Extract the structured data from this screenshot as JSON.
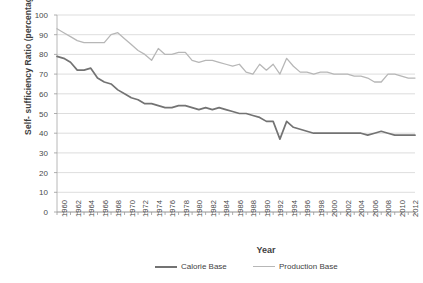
{
  "chart_data": {
    "type": "line",
    "title": "",
    "xlabel": "Year",
    "ylabel": "Self- sufficiency Ratio (percentage)",
    "ylim": [
      0,
      100
    ],
    "ytick_step": 10,
    "yticks": [
      "0",
      "10",
      "20",
      "30",
      "40",
      "50",
      "60",
      "70",
      "80",
      "90",
      "100"
    ],
    "xlim": [
      1960,
      2013
    ],
    "grid": "horizontal",
    "legend_position": "bottom",
    "x": [
      1960,
      1961,
      1962,
      1963,
      1964,
      1965,
      1966,
      1967,
      1968,
      1969,
      1970,
      1971,
      1972,
      1973,
      1974,
      1975,
      1976,
      1977,
      1978,
      1979,
      1980,
      1981,
      1982,
      1983,
      1984,
      1985,
      1986,
      1987,
      1988,
      1989,
      1990,
      1991,
      1992,
      1993,
      1994,
      1995,
      1996,
      1997,
      1998,
      1999,
      2000,
      2001,
      2002,
      2003,
      2004,
      2005,
      2006,
      2007,
      2008,
      2009,
      2010,
      2011,
      2012,
      2013
    ],
    "tick_labels": [
      "1960",
      "1962",
      "1964",
      "1966",
      "1968",
      "1970",
      "1972",
      "1974",
      "1976",
      "1978",
      "1980",
      "1982",
      "1984",
      "1986",
      "1988",
      "1990",
      "1992",
      "1994",
      "1996",
      "1998",
      "2000",
      "2002",
      "2004",
      "2006",
      "2008",
      "2010",
      "2012"
    ],
    "series": [
      {
        "name": "Calorie Base",
        "color": "#737373",
        "values": [
          79,
          78,
          76,
          72,
          72,
          73,
          68,
          66,
          65,
          62,
          60,
          58,
          57,
          55,
          55,
          54,
          53,
          53,
          54,
          54,
          53,
          52,
          53,
          52,
          53,
          52,
          51,
          50,
          50,
          49,
          48,
          46,
          46,
          37,
          46,
          43,
          42,
          41,
          40,
          40,
          40,
          40,
          40,
          40,
          40,
          40,
          39,
          40,
          41,
          40,
          39,
          39,
          39,
          39
        ]
      },
      {
        "name": "Production Base",
        "color": "#b7b7b7",
        "values": [
          93,
          91,
          89,
          87,
          86,
          86,
          86,
          86,
          90,
          91,
          88,
          85,
          82,
          80,
          77,
          83,
          80,
          80,
          81,
          81,
          77,
          76,
          77,
          77,
          76,
          75,
          74,
          75,
          71,
          70,
          75,
          72,
          75,
          70,
          78,
          74,
          71,
          71,
          70,
          71,
          71,
          70,
          70,
          70,
          69,
          69,
          68,
          66,
          66,
          70,
          70,
          69,
          68,
          68
        ]
      }
    ]
  },
  "axis": {
    "y_title": "Self- sufficiency Ratio (percentage)",
    "x_title": "Year"
  },
  "legend": {
    "items": [
      {
        "label": "Calorie Base",
        "color": "#737373"
      },
      {
        "label": "Production Base",
        "color": "#b7b7b7"
      }
    ]
  }
}
